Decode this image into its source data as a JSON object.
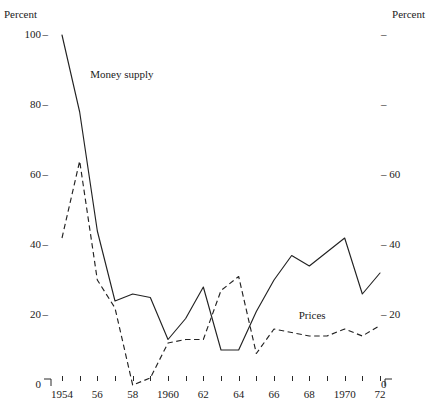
{
  "chart_data": {
    "type": "line",
    "title": "",
    "xlabel": "",
    "ylabel": "Percent",
    "y2label": "Percent",
    "left_axis_title": "Percent",
    "right_axis_title": "Percent",
    "ylim": [
      0,
      100
    ],
    "xlim": [
      1954,
      1972
    ],
    "grid": false,
    "legend_position": "inline-annotations",
    "left_tick_labels": [
      "100",
      "80",
      "60",
      "40",
      "20",
      "0"
    ],
    "left_tick_values": [
      100,
      80,
      60,
      40,
      20,
      0
    ],
    "right_tick_labels": [
      "",
      "",
      "60",
      "40",
      "20",
      "0"
    ],
    "right_tick_values": [
      100,
      80,
      60,
      40,
      20,
      0
    ],
    "x_tick_labels": [
      "1954",
      "",
      "56",
      "",
      "58",
      "",
      "1960",
      "",
      "62",
      "",
      "64",
      "",
      "66",
      "",
      "68",
      "",
      "1970",
      "",
      "72"
    ],
    "x": [
      1954,
      1955,
      1956,
      1957,
      1958,
      1959,
      1960,
      1961,
      1962,
      1963,
      1964,
      1965,
      1966,
      1967,
      1968,
      1969,
      1970,
      1971,
      1972
    ],
    "series": [
      {
        "name": "Money supply",
        "style": "solid",
        "color": "#222222",
        "label_x": 1955.6,
        "label_y": 89,
        "values": [
          100,
          78,
          44,
          24,
          26,
          25,
          13,
          19,
          28,
          10,
          10,
          21,
          30,
          37,
          34,
          38,
          42,
          26,
          32
        ]
      },
      {
        "name": "Prices",
        "style": "dashed",
        "color": "#222222",
        "label_x": 1967.4,
        "label_y": 20,
        "values": [
          42,
          64,
          30,
          22,
          0,
          2,
          12,
          13,
          13,
          27,
          31,
          9,
          16,
          15,
          14,
          14,
          16,
          14,
          17
        ]
      }
    ]
  }
}
